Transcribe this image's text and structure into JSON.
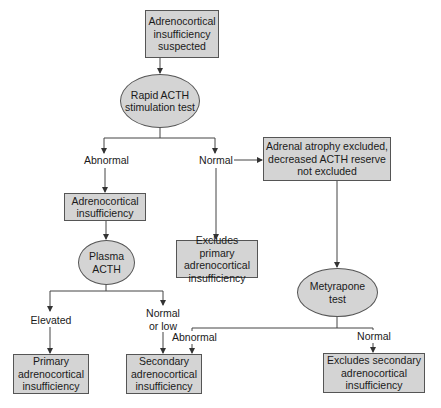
{
  "diagram": {
    "type": "flowchart",
    "colors": {
      "node_fill": "#d4d4d4",
      "line": "#444444",
      "background": "#ffffff"
    },
    "nodes": {
      "suspected": {
        "shape": "box",
        "text": "Adrenocortical\ninsufficiency\nsuspected"
      },
      "rapid_acth": {
        "shape": "ellipse",
        "text": "Rapid ACTH\nstimulation test"
      },
      "adrenal_atrophy": {
        "shape": "box",
        "text": "Adrenal atrophy excluded,\ndecreased ACTH reserve\nnot excluded"
      },
      "adrenocortical_insufficiency": {
        "shape": "box",
        "text": "Adrenocortical\ninsufficiency"
      },
      "excludes_primary": {
        "shape": "box",
        "text": "Excludes primary\nadrenocortical\ninsufficiency"
      },
      "plasma_acth": {
        "shape": "ellipse",
        "text": "Plasma\nACTH"
      },
      "metyrapone": {
        "shape": "ellipse",
        "text": "Metyrapone\ntest"
      },
      "primary": {
        "shape": "box",
        "text": "Primary\nadrenocortical\ninsufficiency"
      },
      "secondary": {
        "shape": "box",
        "text": "Secondary\nadrenocortical\ninsufficiency"
      },
      "excludes_secondary": {
        "shape": "box",
        "text": "Excludes secondary\nadrenocortical\ninsufficiency"
      }
    },
    "edge_labels": {
      "rapid_abnormal": "Abnormal",
      "rapid_normal": "Normal",
      "plasma_elevated": "Elevated",
      "plasma_normal_low": "Normal\nor low",
      "metyrapone_abnormal": "Abnormal",
      "metyrapone_normal": "Normal"
    },
    "edges": [
      {
        "from": "suspected",
        "to": "rapid_acth"
      },
      {
        "from": "rapid_acth",
        "to": "adrenocortical_insufficiency",
        "label": "Abnormal"
      },
      {
        "from": "rapid_acth",
        "to": "excludes_primary",
        "label": "Normal"
      },
      {
        "from": "rapid_acth",
        "to": "adrenal_atrophy",
        "label": "Normal"
      },
      {
        "from": "adrenocortical_insufficiency",
        "to": "plasma_acth"
      },
      {
        "from": "adrenal_atrophy",
        "to": "metyrapone"
      },
      {
        "from": "plasma_acth",
        "to": "primary",
        "label": "Elevated"
      },
      {
        "from": "plasma_acth",
        "to": "secondary",
        "label": "Normal or low"
      },
      {
        "from": "metyrapone",
        "to": "secondary",
        "label": "Abnormal"
      },
      {
        "from": "metyrapone",
        "to": "excludes_secondary",
        "label": "Normal"
      }
    ]
  }
}
